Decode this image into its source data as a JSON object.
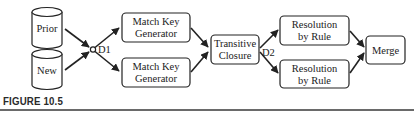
{
  "figure": {
    "caption": "FIGURE 10.5",
    "colors": {
      "stroke": "#222222",
      "background": "#ffffff",
      "rule": "#6a6a6a"
    }
  },
  "sources": [
    {
      "id": "prior",
      "label": "Prior",
      "shape": "database-cylinder"
    },
    {
      "id": "new",
      "label": "New",
      "shape": "database-cylinder"
    }
  ],
  "junctions": [
    {
      "id": "d1",
      "label": "D1"
    },
    {
      "id": "d2",
      "label": "D2"
    }
  ],
  "nodes": {
    "match_key_top": {
      "line1": "Match Key",
      "line2": "Generator"
    },
    "match_key_bottom": {
      "line1": "Match Key",
      "line2": "Generator"
    },
    "transitive_closure": {
      "line1": "Transitive",
      "line2": "Closure"
    },
    "resolution_top": {
      "line1": "Resolution",
      "line2": "by Rule"
    },
    "resolution_bottom": {
      "line1": "Resolution",
      "line2": "by Rule"
    },
    "merge": {
      "line1": "Merge"
    }
  },
  "edges": [
    {
      "from": "Prior",
      "to": "D1"
    },
    {
      "from": "New",
      "to": "D1"
    },
    {
      "from": "D1",
      "to": "Match Key Generator (top)"
    },
    {
      "from": "D1",
      "to": "Match Key Generator (bottom)"
    },
    {
      "from": "Match Key Generator (top)",
      "to": "Transitive Closure"
    },
    {
      "from": "Match Key Generator (bottom)",
      "to": "Transitive Closure"
    },
    {
      "from": "Transitive Closure",
      "to": "Resolution by Rule (top)",
      "via": "D2"
    },
    {
      "from": "Transitive Closure",
      "to": "Resolution by Rule (bottom)",
      "via": "D2"
    },
    {
      "from": "Resolution by Rule (top)",
      "to": "Merge"
    },
    {
      "from": "Resolution by Rule (bottom)",
      "to": "Merge"
    }
  ]
}
